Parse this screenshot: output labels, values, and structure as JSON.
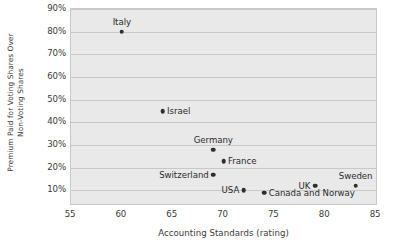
{
  "chart_data": {
    "type": "scatter",
    "title": "",
    "xlabel": "Accounting Standards (rating)",
    "ylabel": "Premium Paid for Voting Shares Over Non-Voting Shares",
    "ylabel_line1": "Premium Paid for Voting Shares Over",
    "ylabel_line2": "Non-Voting Shares",
    "xlim": [
      55,
      85
    ],
    "ylim": [
      4,
      90
    ],
    "xticks": [
      55,
      60,
      65,
      70,
      75,
      80,
      85
    ],
    "xticklabels": [
      "55",
      "60",
      "65",
      "70",
      "75",
      "80",
      "85"
    ],
    "yticks": [
      10,
      20,
      30,
      40,
      50,
      60,
      70,
      80,
      90
    ],
    "yticklabels": [
      "10%",
      "20%",
      "30%",
      "40%",
      "50%",
      "60%",
      "70%",
      "80%",
      "90%"
    ],
    "grid": "horizontal",
    "legend": "none",
    "plot_background": "#e9e9e9",
    "gridline_color": "#c8c8c8",
    "marker_color": "#2e2e2e",
    "points": [
      {
        "label": "Italy",
        "x": 60,
        "y": 80,
        "label_pos": "above"
      },
      {
        "label": "Israel",
        "x": 64,
        "y": 45,
        "label_pos": "right"
      },
      {
        "label": "Germany",
        "x": 69,
        "y": 28,
        "label_pos": "above"
      },
      {
        "label": "France",
        "x": 70,
        "y": 23,
        "label_pos": "right"
      },
      {
        "label": "Switzerland",
        "x": 69,
        "y": 17,
        "label_pos": "left"
      },
      {
        "label": "USA",
        "x": 72,
        "y": 10,
        "label_pos": "left"
      },
      {
        "label": "Canada and Norway",
        "x": 74,
        "y": 9,
        "label_pos": "right"
      },
      {
        "label": "UK",
        "x": 79,
        "y": 12,
        "label_pos": "left"
      },
      {
        "label": "Sweden",
        "x": 83,
        "y": 12,
        "label_pos": "above"
      }
    ]
  }
}
